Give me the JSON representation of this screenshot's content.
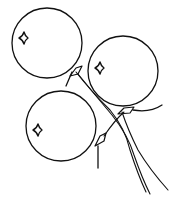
{
  "image": {
    "subject": "Line drawing of three balloons tied together with trailing strings",
    "stroke_color": "#111111",
    "background_color": "#ffffff",
    "balloons": [
      {
        "name": "top-left",
        "cx": 47,
        "cy": 42,
        "r": 35
      },
      {
        "name": "right",
        "cx": 123,
        "cy": 70,
        "r": 35
      },
      {
        "name": "bottom-left",
        "cx": 61,
        "cy": 125,
        "r": 35
      }
    ]
  }
}
